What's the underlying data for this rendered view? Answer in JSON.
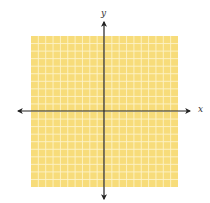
{
  "diagram": {
    "type": "coordinate-plane",
    "grid": {
      "columns": 20,
      "rows": 20,
      "fill_color": "#F7DC7A",
      "line_color": "#FDF3C8"
    },
    "axes": {
      "x_label": "x",
      "y_label": "y",
      "color": "#222222",
      "arrows": [
        "left",
        "right",
        "up",
        "down"
      ]
    }
  }
}
